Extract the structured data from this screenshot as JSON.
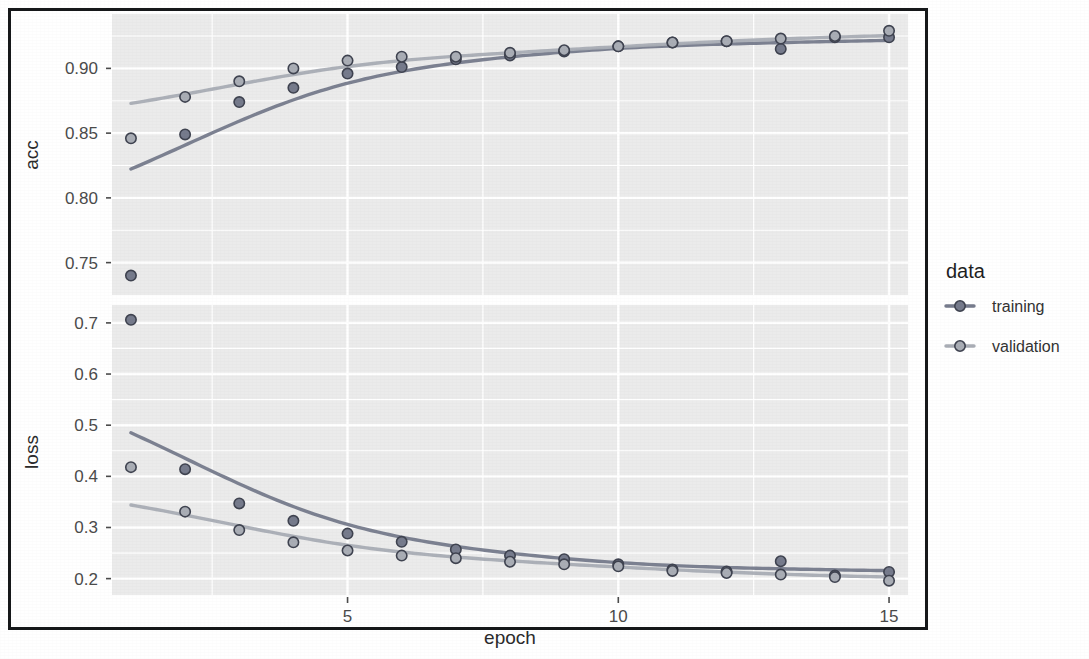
{
  "figure": {
    "background_color": "#ffffff",
    "frame_color": "#16181a",
    "panel_color": "#ebebeb",
    "gridline_color": "#ffffff"
  },
  "legend": {
    "title": "data",
    "position": "right",
    "items": [
      {
        "label": "training",
        "color": "#767b8c"
      },
      {
        "label": "validation",
        "color": "#a9adb5"
      }
    ]
  },
  "axis": {
    "x_title": "epoch",
    "x_ticks": [
      "5",
      "10",
      "15"
    ],
    "acc_title": "acc",
    "acc_ticks": [
      "0.75",
      "0.80",
      "0.85",
      "0.90"
    ],
    "loss_title": "loss",
    "loss_ticks": [
      "0.2",
      "0.3",
      "0.4",
      "0.5",
      "0.6",
      "0.7"
    ]
  },
  "chart_data": {
    "type": "scatter",
    "title": "",
    "subtitle": "",
    "xlabel": "epoch",
    "ylabel": "",
    "legend_title": "data",
    "legend_position": "right",
    "grid": true,
    "facets": [
      {
        "name": "acc",
        "ylabel": "acc",
        "ytick_values": [
          0.75,
          0.8,
          0.85,
          0.9
        ],
        "ytick_labels": [
          "0.75",
          "0.80",
          "0.85",
          "0.90"
        ],
        "ylim": [
          0.725,
          0.942
        ],
        "series": [
          {
            "name": "training",
            "color": "#767b8c",
            "x": [
              1,
              2,
              3,
              4,
              5,
              6,
              7,
              8,
              9,
              10,
              11,
              12,
              13,
              14,
              15
            ],
            "values": [
              0.74,
              0.849,
              0.874,
              0.885,
              0.896,
              0.901,
              0.907,
              0.91,
              0.913,
              0.917,
              0.92,
              0.921,
              0.915,
              0.924,
              0.924
            ],
            "has_smooth_curve": true
          },
          {
            "name": "validation",
            "color": "#a9adb5",
            "x": [
              1,
              2,
              3,
              4,
              5,
              6,
              7,
              8,
              9,
              10,
              11,
              12,
              13,
              14,
              15
            ],
            "values": [
              0.846,
              0.878,
              0.89,
              0.9,
              0.906,
              0.909,
              0.909,
              0.912,
              0.914,
              0.917,
              0.92,
              0.921,
              0.923,
              0.925,
              0.929
            ],
            "has_smooth_curve": true
          }
        ]
      },
      {
        "name": "loss",
        "ylabel": "loss",
        "ytick_values": [
          0.2,
          0.3,
          0.4,
          0.5,
          0.6,
          0.7
        ],
        "ytick_labels": [
          "0.2",
          "0.3",
          "0.4",
          "0.5",
          "0.6",
          "0.7"
        ],
        "ylim": [
          0.168,
          0.735
        ],
        "series": [
          {
            "name": "training",
            "color": "#767b8c",
            "x": [
              1,
              2,
              3,
              4,
              5,
              6,
              7,
              8,
              9,
              10,
              11,
              12,
              13,
              14,
              15
            ],
            "values": [
              0.706,
              0.414,
              0.347,
              0.313,
              0.288,
              0.272,
              0.257,
              0.245,
              0.238,
              0.228,
              0.218,
              0.214,
              0.234,
              0.206,
              0.213
            ],
            "has_smooth_curve": true
          },
          {
            "name": "validation",
            "color": "#a9adb5",
            "x": [
              1,
              2,
              3,
              4,
              5,
              6,
              7,
              8,
              9,
              10,
              11,
              12,
              13,
              14,
              15
            ],
            "values": [
              0.418,
              0.331,
              0.295,
              0.271,
              0.255,
              0.245,
              0.24,
              0.233,
              0.228,
              0.224,
              0.215,
              0.211,
              0.208,
              0.203,
              0.196
            ],
            "has_smooth_curve": true
          }
        ]
      }
    ],
    "x": [
      1,
      2,
      3,
      4,
      5,
      6,
      7,
      8,
      9,
      10,
      11,
      12,
      13,
      14,
      15
    ],
    "xlim": [
      0.65,
      15.35
    ],
    "xtick_values": [
      5,
      10,
      15
    ],
    "xtick_labels": [
      "5",
      "10",
      "15"
    ]
  }
}
